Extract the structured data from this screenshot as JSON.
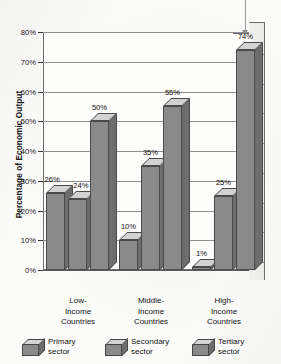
{
  "chart_data": {
    "type": "bar",
    "title": "",
    "subtitle": "",
    "xlabel": "",
    "ylabel": "Percentage of Economic Output",
    "ylim": [
      0,
      80
    ],
    "y_tick_labels": [
      "0%",
      "10%",
      "20%",
      "30%",
      "40%",
      "50%",
      "60%",
      "70%",
      "80%"
    ],
    "y_tick_values": [
      0,
      10,
      20,
      30,
      40,
      50,
      60,
      70,
      80
    ],
    "grid": true,
    "legend_position": "bottom",
    "style": "3d-grouped-bars-grayscale",
    "categories": [
      "Low-Income Countries",
      "Middle-Income Countries",
      "High-Income Countries"
    ],
    "series": [
      {
        "name": "Primary sector",
        "values": [
          26,
          10,
          1
        ],
        "labels": [
          "26%",
          "10%",
          "1%"
        ]
      },
      {
        "name": "Secondary sector",
        "values": [
          24,
          35,
          25
        ],
        "labels": [
          "24%",
          "35%",
          "25%"
        ]
      },
      {
        "name": "Tertiary sector",
        "values": [
          50,
          55,
          74
        ],
        "labels": [
          "50%",
          "55%",
          "74%"
        ]
      }
    ],
    "annotations": [
      {
        "name": "pointer-to-tertiary-high-income",
        "target": "74%"
      }
    ]
  },
  "axis": {
    "y_title": "Percentage of Economic Output",
    "ticks": [
      {
        "label": "80%",
        "value": 80
      },
      {
        "label": "70%",
        "value": 70
      },
      {
        "label": "60%",
        "value": 60
      },
      {
        "label": "50%",
        "value": 50
      },
      {
        "label": "40%",
        "value": 40
      },
      {
        "label": "30%",
        "value": 30
      },
      {
        "label": "20%",
        "value": 20
      },
      {
        "label": "10%",
        "value": 10
      },
      {
        "label": "0%",
        "value": 0
      }
    ]
  },
  "categories": [
    {
      "line1": "Low-",
      "line2": "Income",
      "line3": "Countries"
    },
    {
      "line1": "Middle-",
      "line2": "Income",
      "line3": "Countries"
    },
    {
      "line1": "High-",
      "line2": "Income",
      "line3": "Countries"
    }
  ],
  "bars": [
    {
      "group": 0,
      "series": 0,
      "label": "26%",
      "value": 26
    },
    {
      "group": 0,
      "series": 1,
      "label": "24%",
      "value": 24
    },
    {
      "group": 0,
      "series": 2,
      "label": "50%",
      "value": 50
    },
    {
      "group": 1,
      "series": 0,
      "label": "10%",
      "value": 10
    },
    {
      "group": 1,
      "series": 1,
      "label": "35%",
      "value": 35
    },
    {
      "group": 1,
      "series": 2,
      "label": "55%",
      "value": 55
    },
    {
      "group": 2,
      "series": 0,
      "label": "1%",
      "value": 1
    },
    {
      "group": 2,
      "series": 1,
      "label": "25%",
      "value": 25
    },
    {
      "group": 2,
      "series": 2,
      "label": "74%",
      "value": 74
    }
  ],
  "legend": [
    {
      "line1": "Primary",
      "line2": "sector"
    },
    {
      "line1": "Secondary",
      "line2": "sector"
    },
    {
      "line1": "Tertiary",
      "line2": "sector"
    }
  ],
  "colors": {
    "bar_front": "#8a8a8a",
    "bar_top": "#d2d2d2",
    "bar_side": "#6d6d6d",
    "outline": "#4a4a4a",
    "gridline": "#8f8f8f",
    "plot_background": "#fcfcfb",
    "page_background": "#fbfbfa",
    "text": "#151515"
  }
}
